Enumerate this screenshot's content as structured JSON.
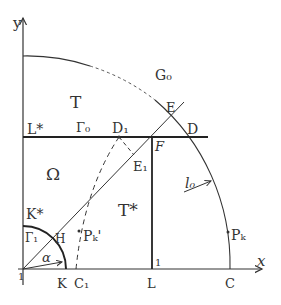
{
  "diagram": {
    "axes": {
      "x_label": "x",
      "y_label": "y",
      "origin_label": "1"
    },
    "regions": {
      "T": "T",
      "T_star": "T*",
      "Omega": "Ω"
    },
    "curves": {
      "G0": "G₀",
      "Gamma0": "Γ₀",
      "Gamma1": "Γ₁",
      "l0": "l₀"
    },
    "points": {
      "L_star": "L*",
      "D1": "D₁",
      "F": "F",
      "E": "E",
      "D": "D",
      "E1": "E₁",
      "K_star": "K*",
      "H": "H",
      "K": "K",
      "C1": "C₁",
      "L": "L",
      "C": "C",
      "Pk": "Pₖ",
      "Pk_prime": "Pₖ'"
    },
    "angle": "α",
    "unit_mark": "1",
    "colors": {
      "ink": "#333333",
      "background": "#ffffff"
    }
  }
}
